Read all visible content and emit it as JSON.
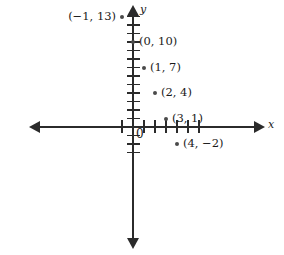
{
  "chart_data": {
    "type": "scatter",
    "title": "",
    "xlabel": "x",
    "ylabel": "y",
    "origin_label": "0",
    "xlim": [
      -2,
      7
    ],
    "ylim": [
      -6,
      15
    ],
    "grid": false,
    "legend": null,
    "x": [
      -1,
      0,
      1,
      2,
      3,
      4
    ],
    "y": [
      13,
      10,
      7,
      4,
      1,
      -2
    ],
    "points": [
      {
        "label": "(−1, 13)",
        "x": -1,
        "y": 13,
        "label_side": "left"
      },
      {
        "label": "(0, 10)",
        "x": 0,
        "y": 10,
        "label_side": "right"
      },
      {
        "label": "(1, 7)",
        "x": 1,
        "y": 7,
        "label_side": "right"
      },
      {
        "label": "(2, 4)",
        "x": 2,
        "y": 4,
        "label_side": "right"
      },
      {
        "label": "(3, 1)",
        "x": 3,
        "y": 1,
        "label_side": "right"
      },
      {
        "label": "(4, −2)",
        "x": 4,
        "y": -2,
        "label_side": "right"
      }
    ]
  },
  "axes": {
    "x_name": "x",
    "y_name": "y",
    "origin": "0",
    "y_ticks_above_origin": 13,
    "y_ticks_below_origin": 3,
    "x_ticks_right_of_origin": 6,
    "x_ticks_left_of_origin": 1
  },
  "geometry": {
    "origin_px": {
      "x": 133,
      "y": 127
    },
    "x_unit_px": 11.0,
    "y_unit_px": 8.5
  }
}
